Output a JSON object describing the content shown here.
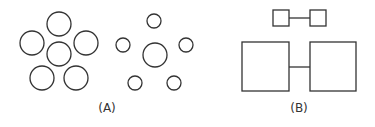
{
  "figure": {
    "panels": [
      {
        "label": "(A)",
        "description": "Two groups of circles: six large equal circles clustered vs. a large central circle surrounded by five small circles"
      },
      {
        "label": "(B)",
        "description": "Two small connected squares above two large connected squares"
      }
    ]
  },
  "colors": {
    "stroke": "#333333",
    "background": "#ffffff"
  }
}
